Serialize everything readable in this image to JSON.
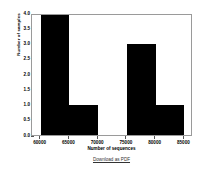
{
  "chart_data": {
    "type": "bar",
    "title": "",
    "xlabel": "Number of sequences",
    "ylabel": "Number of samples",
    "xlim": [
      58500,
      86500
    ],
    "ylim": [
      0.0,
      4.0
    ],
    "grid": false,
    "legend": "none",
    "bin_width": 5000,
    "categories": [
      "60000-65000",
      "65000-70000",
      "70000-75000",
      "75000-80000",
      "80000-85000"
    ],
    "bin_starts": [
      60000,
      65000,
      70000,
      75000,
      80000
    ],
    "values": [
      4,
      1,
      0,
      3,
      1
    ],
    "xticks": [
      {
        "value": 60000,
        "label": "60000"
      },
      {
        "value": 65000,
        "label": "65000"
      },
      {
        "value": 70000,
        "label": "70000"
      },
      {
        "value": 75000,
        "label": "75000"
      },
      {
        "value": 80000,
        "label": "80000"
      },
      {
        "value": 85000,
        "label": "85000"
      }
    ],
    "yticks": [
      {
        "value": 0.0,
        "label": "0.0"
      },
      {
        "value": 0.5,
        "label": "0.5"
      },
      {
        "value": 1.0,
        "label": "1.0"
      },
      {
        "value": 1.5,
        "label": "1.5"
      },
      {
        "value": 2.0,
        "label": "2.0"
      },
      {
        "value": 2.5,
        "label": "2.5"
      },
      {
        "value": 3.0,
        "label": "3.0"
      },
      {
        "value": 3.5,
        "label": "3.5"
      },
      {
        "value": 4.0,
        "label": "4.0"
      }
    ],
    "bar_color": "#000000",
    "frame_color": "#9a9a9a",
    "background": "#ffffff"
  },
  "footer": {
    "download_label": "Download as PDF"
  }
}
